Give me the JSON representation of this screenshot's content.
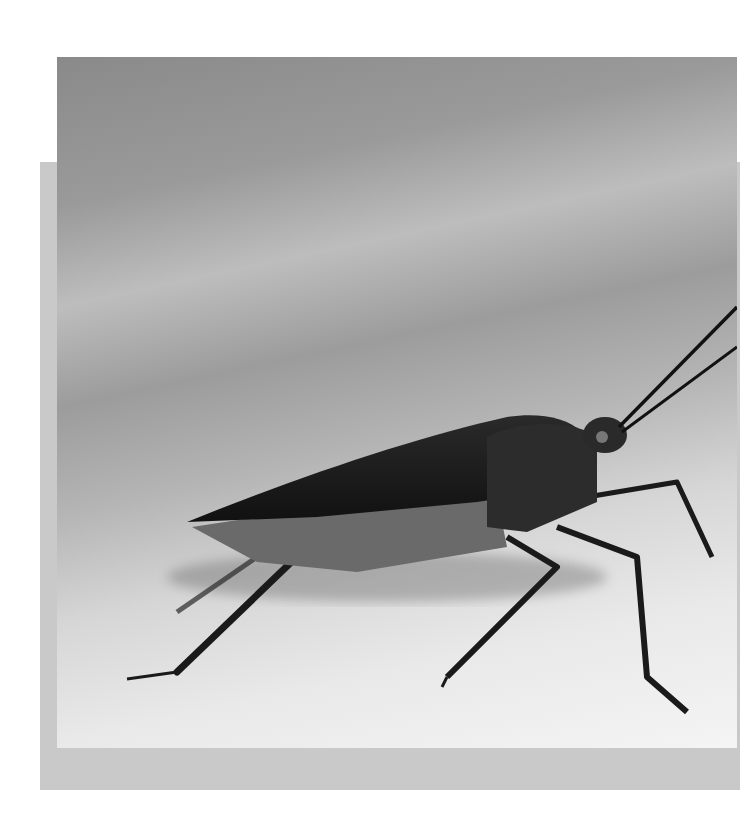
{
  "image": {
    "subject": "insect (bug) on a surface",
    "style": "grayscale macro photograph",
    "colors": {
      "page_background": "#ffffff",
      "back_frame": "#c9c9c9",
      "insect_body": "#1e1e1e",
      "surface_light": "#f0f0f0"
    }
  }
}
